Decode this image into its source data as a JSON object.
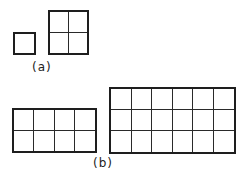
{
  "figure": {
    "stroke_color": "#1e1e1e",
    "groups": [
      {
        "label": "(a)",
        "shapes": [
          {
            "name": "small-square",
            "rows": 1,
            "cols": 1,
            "x": 13,
            "y": 32,
            "w": 23,
            "h": 23
          },
          {
            "name": "grid-2x2",
            "rows": 2,
            "cols": 2,
            "x": 48,
            "y": 10,
            "w": 41,
            "h": 45
          }
        ],
        "label_pos": {
          "x": 32,
          "y": 60
        }
      },
      {
        "label": "(b)",
        "shapes": [
          {
            "name": "grid-2x4",
            "rows": 2,
            "cols": 4,
            "x": 12,
            "y": 108,
            "w": 85,
            "h": 45
          },
          {
            "name": "grid-3x6",
            "rows": 3,
            "cols": 6,
            "x": 109,
            "y": 87,
            "w": 127,
            "h": 67
          }
        ],
        "label_pos": {
          "x": 93,
          "y": 156
        }
      }
    ]
  }
}
